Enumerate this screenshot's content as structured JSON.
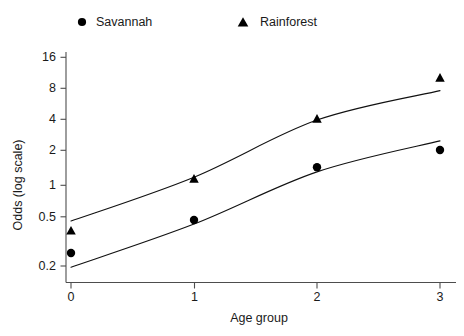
{
  "chart_data": {
    "type": "scatter",
    "title": "",
    "xlabel": "Age group",
    "ylabel": "Odds (log scale)",
    "yscale": "log",
    "xlim": [
      -0.12,
      3.12
    ],
    "ylim": [
      0.15,
      20
    ],
    "grid": false,
    "legend_position": "top",
    "x": [
      0,
      1,
      2,
      3
    ],
    "xtick_labels": [
      "0",
      "1",
      "2",
      "3"
    ],
    "ytick_values": [
      0.2,
      0.5,
      1,
      2,
      4,
      8,
      16
    ],
    "ytick_labels": [
      "0.2",
      "0.5",
      "1",
      "2",
      "4",
      "8",
      "16"
    ],
    "series": [
      {
        "name": "Savannah",
        "marker": "circle",
        "color": "#000000",
        "values": [
          0.22,
          0.46,
          1.5,
          2.2
        ],
        "fit_line": [
          0.16,
          0.42,
          1.35,
          2.7
        ]
      },
      {
        "name": "Rainforest",
        "marker": "triangle",
        "color": "#000000",
        "values": [
          0.36,
          1.15,
          4.4,
          11.0
        ],
        "fit_line": [
          0.45,
          1.2,
          4.3,
          8.3
        ]
      }
    ]
  },
  "legend": {
    "items": [
      {
        "label": "Savannah",
        "marker": "circle"
      },
      {
        "label": "Rainforest",
        "marker": "triangle"
      }
    ]
  },
  "axes": {
    "x_title": "Age group",
    "y_title": "Odds (log scale)"
  }
}
